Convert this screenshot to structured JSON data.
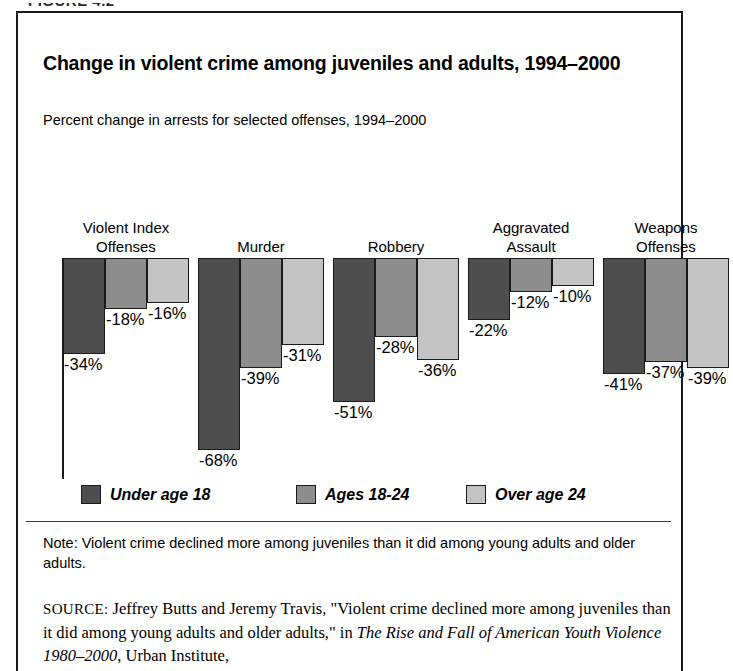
{
  "figure": {
    "caption": "FIGURE 4.2"
  },
  "chart": {
    "title": "Change in violent crime among juveniles and adults, 1994–2000",
    "subtitle": "Percent change in arrests for selected offenses, 1994–2000"
  },
  "note": {
    "text": "Note: Violent crime declined more among juveniles than it did among young adults and older adults."
  },
  "source": {
    "label": "SOURCE:",
    "part1": " Jeffrey Butts and Jeremy Travis, \"Violent crime declined more among juveniles than it did among young adults and older adults,\" in ",
    "title_italic": "The Rise and Fall of American Youth Violence 1980–2000",
    "part2": ", Urban Institute,"
  },
  "colors": {
    "series0": "#4e4e4e",
    "series1": "#8d8d8d",
    "series2": "#c3c3c3",
    "frame": "#1a1a1a",
    "background": "#ffffff"
  },
  "chart_data": {
    "type": "bar",
    "title": "Change in violent crime among juveniles and adults, 1994–2000",
    "subtitle": "Percent change in arrests for selected offenses, 1994–2000",
    "xlabel": "",
    "ylabel": "",
    "ylim": [
      -75,
      0
    ],
    "grid": false,
    "legend_position": "bottom",
    "units": "percent",
    "categories": [
      "Violent Index\nOffenses",
      "Murder",
      "Robbery",
      "Aggravated\nAssault",
      "Weapons\nOffenses"
    ],
    "series": [
      {
        "name": "Under age 18",
        "color": "#4e4e4e",
        "values": [
          -34,
          -68,
          -51,
          -22,
          -41
        ],
        "labels": [
          "-34%",
          "-68%",
          "-51%",
          "-22%",
          "-41%"
        ]
      },
      {
        "name": "Ages 18-24",
        "color": "#8d8d8d",
        "values": [
          -18,
          -39,
          -28,
          -12,
          -37
        ],
        "labels": [
          "-18%",
          "-39%",
          "-28%",
          "-12%",
          "-37%"
        ]
      },
      {
        "name": "Over age 24",
        "color": "#c3c3c3",
        "values": [
          -16,
          -31,
          -36,
          -10,
          -39
        ],
        "labels": [
          "-16%",
          "-31%",
          "-36%",
          "-10%",
          "-39%"
        ]
      }
    ]
  }
}
